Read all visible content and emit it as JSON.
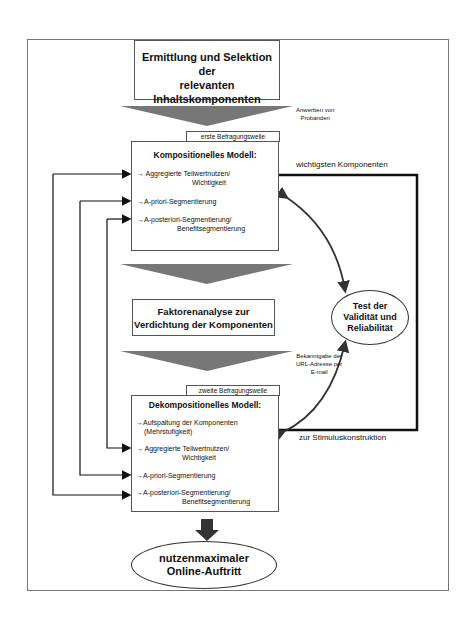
{
  "diagram": {
    "top_box": {
      "lines": [
        "Ermittlung und Selektion der",
        "relevanten",
        "Inhaltskomponenten"
      ]
    },
    "arrow_label_1": [
      "Anwerben von",
      "Probanden"
    ],
    "wave1_tag": "erste Befragungswelle",
    "compositional_model": {
      "title": "Kompositionelles Modell:",
      "items": [
        {
          "line1": "→ Aggregierte Teilwertnutzen/",
          "line2": "Wichtigkeit"
        },
        {
          "line1": "→A-priori-Segmentierung",
          "line2": ""
        },
        {
          "line1": "→A-posteriori-Segmentierung/",
          "line2": "Benefitsegmentierung"
        }
      ]
    },
    "label_top_right": "wichtigsten Komponenten",
    "factor_box": {
      "lines": [
        "Faktorenanalyse zur",
        "Verdichtung der Komponenten"
      ]
    },
    "test_ellipse": {
      "lines": [
        "Test der",
        "Validität und",
        "Reliabilität"
      ]
    },
    "arrow_label_2": [
      "Bekanntgabe der",
      "URL-Adresse per",
      "E-mail"
    ],
    "wave2_tag": "zweite Befragungswelle",
    "decompositional_model": {
      "title": "Dekompositionelles Modell:",
      "items": [
        {
          "line1": "→Aufspaltung der Komponenten",
          "line2": "(Mehrstufigkeit)"
        },
        {
          "line1": "→ Aggregierte Teilwertnutzen/",
          "line2": "Wichtigkeit"
        },
        {
          "line1": "→A-priori-Segmentierung",
          "line2": ""
        },
        {
          "line1": "→A-posteriori-Segmentierung/",
          "line2": "Benefitsegmentierung"
        }
      ]
    },
    "label_bottom_right": "zur Stimuluskonstruktion",
    "result_ellipse": {
      "lines": [
        "nutzenmaximaler",
        "Online-Auftritt"
      ]
    },
    "colors": {
      "funnel": "#777777",
      "line": "#111111",
      "frame": "#777777"
    }
  }
}
